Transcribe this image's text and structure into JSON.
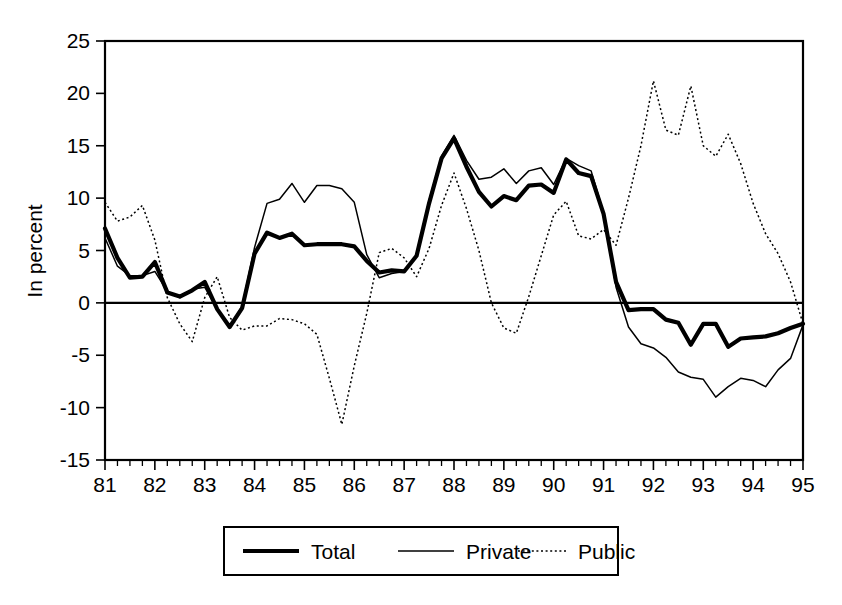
{
  "chart_data": {
    "type": "line",
    "title": "",
    "subtitle": "",
    "xlabel": "",
    "ylabel": "In percent",
    "xlim": [
      1981.0,
      1995.0
    ],
    "ylim": [
      -15,
      25
    ],
    "yticks": [
      -15,
      -10,
      -5,
      0,
      5,
      10,
      15,
      20,
      25
    ],
    "ytick_labels": [
      "-15",
      "-10",
      "-5",
      "0",
      "5",
      "10",
      "15",
      "20",
      "25"
    ],
    "xticks": [
      1981,
      1982,
      1983,
      1984,
      1985,
      1986,
      1987,
      1988,
      1989,
      1990,
      1991,
      1992,
      1993,
      1994,
      1995
    ],
    "xtick_labels": [
      "81",
      "82",
      "83",
      "84",
      "85",
      "86",
      "87",
      "88",
      "89",
      "90",
      "91",
      "92",
      "93",
      "94",
      "95"
    ],
    "x_minor_ticks_per_year": 4,
    "grid": false,
    "zero_line": true,
    "legend_position": "bottom-outside",
    "legend_entries": [
      "Total",
      "Private",
      "Public"
    ],
    "x": [
      1981.0,
      1981.25,
      1981.5,
      1981.75,
      1982.0,
      1982.25,
      1982.5,
      1982.75,
      1983.0,
      1983.25,
      1983.5,
      1983.75,
      1984.0,
      1984.25,
      1984.5,
      1984.75,
      1985.0,
      1985.25,
      1985.5,
      1985.75,
      1986.0,
      1986.25,
      1986.5,
      1986.75,
      1987.0,
      1987.25,
      1987.5,
      1987.75,
      1988.0,
      1988.25,
      1988.5,
      1988.75,
      1989.0,
      1989.25,
      1989.5,
      1989.75,
      1990.0,
      1990.25,
      1990.5,
      1990.75,
      1991.0,
      1991.25,
      1991.5,
      1991.75,
      1992.0,
      1992.25,
      1992.5,
      1992.75,
      1993.0,
      1993.25,
      1993.5,
      1993.75,
      1994.0,
      1994.25,
      1994.5,
      1994.75,
      1995.0
    ],
    "series": [
      {
        "name": "Total",
        "style": "thick-solid",
        "color": "#000000",
        "values": [
          7.1,
          4.3,
          2.4,
          2.5,
          3.9,
          1.0,
          0.6,
          1.2,
          2.0,
          -0.6,
          -2.3,
          -0.5,
          4.7,
          6.7,
          6.2,
          6.6,
          5.5,
          5.6,
          5.6,
          5.6,
          5.4,
          4.0,
          2.9,
          3.1,
          3.0,
          4.5,
          9.5,
          13.8,
          15.7,
          13.0,
          10.6,
          9.2,
          10.2,
          9.8,
          11.2,
          11.3,
          10.5,
          13.7,
          12.4,
          12.1,
          8.5,
          2.0,
          -0.7,
          -0.6,
          -0.6,
          -1.6,
          -1.9,
          -4.0,
          -2.0,
          -2.0,
          -4.2,
          -3.4,
          -3.3,
          -3.2,
          -2.9,
          -2.4,
          -2.0
        ]
      },
      {
        "name": "Private",
        "style": "thin-solid",
        "color": "#000000",
        "values": [
          6.2,
          3.5,
          2.6,
          2.6,
          3.0,
          1.1,
          0.5,
          1.3,
          1.5,
          -0.6,
          -2.3,
          -0.3,
          5.3,
          9.5,
          9.9,
          11.4,
          9.6,
          11.2,
          11.2,
          10.9,
          9.6,
          4.6,
          2.4,
          2.8,
          3.0,
          4.6,
          9.8,
          14.0,
          16.0,
          13.6,
          11.8,
          12.0,
          12.8,
          11.4,
          12.6,
          12.9,
          11.3,
          13.8,
          13.1,
          12.6,
          8.6,
          1.5,
          -2.3,
          -3.9,
          -4.3,
          -5.2,
          -6.6,
          -7.1,
          -7.3,
          -9.0,
          -8.0,
          -7.2,
          -7.4,
          -8.0,
          -6.4,
          -5.3,
          -2.1
        ]
      },
      {
        "name": "Public",
        "style": "dotted",
        "color": "#000000",
        "values": [
          9.6,
          7.8,
          8.2,
          9.3,
          6.0,
          0.5,
          -2.0,
          -3.7,
          0.5,
          2.5,
          -1.4,
          -2.6,
          -2.2,
          -2.2,
          -1.5,
          -1.6,
          -2.0,
          -3.0,
          -7.2,
          -11.6,
          -6.0,
          -1.0,
          4.8,
          5.2,
          4.3,
          2.5,
          5.2,
          9.3,
          12.4,
          9.0,
          5.0,
          0.0,
          -2.4,
          -2.9,
          0.6,
          4.5,
          8.4,
          9.7,
          6.4,
          6.1,
          7.0,
          5.5,
          10.0,
          15.0,
          21.2,
          16.5,
          16.0,
          20.7,
          15.0,
          14.0,
          16.1,
          13.3,
          9.5,
          6.6,
          4.7,
          2.0,
          -2.0
        ]
      }
    ]
  },
  "axes": {
    "ylabel": "In percent"
  },
  "legend": {
    "items": [
      {
        "label": "Total",
        "style": "thick-solid"
      },
      {
        "label": "Private",
        "style": "thin-solid"
      },
      {
        "label": "Public",
        "style": "dotted"
      }
    ]
  }
}
